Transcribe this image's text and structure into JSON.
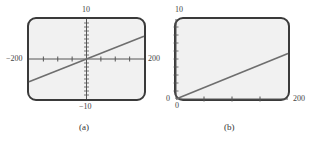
{
  "chart_data": [
    {
      "type": "line",
      "panel_label": "(a)",
      "title": "",
      "xlabel": "",
      "ylabel": "",
      "xlim": [
        -200,
        200
      ],
      "ylim": [
        -10,
        10
      ],
      "x_tick_step": 50,
      "y_tick_step": 1,
      "axis_labels": {
        "xmin": "−200",
        "xmax": "200",
        "ymin": "−10",
        "ymax": "10"
      },
      "grid": false,
      "legend": null,
      "series": [
        {
          "name": "line",
          "x": [
            -200,
            0,
            200
          ],
          "y": [
            -5.7,
            0,
            5.7
          ]
        }
      ]
    },
    {
      "type": "line",
      "panel_label": "(b)",
      "title": "",
      "xlabel": "",
      "ylabel": "",
      "xlim": [
        0,
        200
      ],
      "ylim": [
        0,
        10
      ],
      "x_tick_step": 50,
      "y_tick_step": 1,
      "axis_labels": {
        "xmin": "0",
        "xmax": "200",
        "ymin": "0",
        "ymax": "10"
      },
      "grid": false,
      "legend": null,
      "series": [
        {
          "name": "line",
          "x": [
            0,
            200
          ],
          "y": [
            0,
            5.7
          ]
        }
      ]
    }
  ],
  "colors": {
    "frame": "#3a3a3a",
    "background": "#f1f1f1",
    "line": "#6e6e6e",
    "axis": "#555555"
  }
}
